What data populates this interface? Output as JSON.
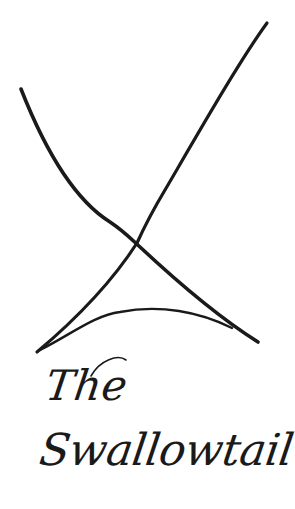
{
  "logo": {
    "wordmark": {
      "line1": "The",
      "line2": "Swallowtail"
    },
    "colors": {
      "background": "#ffffff",
      "ink": "#1a1a1a"
    },
    "mark_icon": "swallowtail-cross-icon"
  }
}
